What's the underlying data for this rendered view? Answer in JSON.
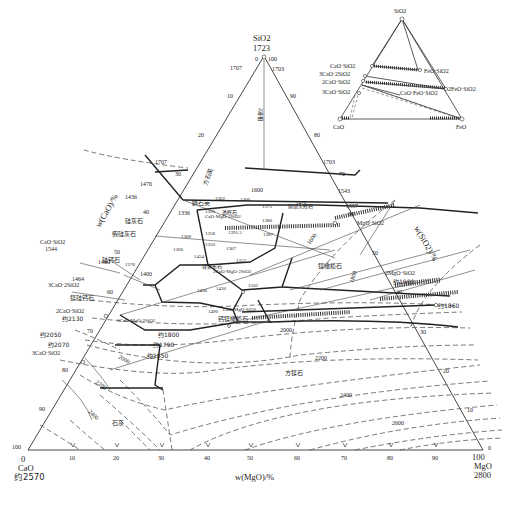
{
  "diagram": {
    "vertices": {
      "top": {
        "label": "SiO2",
        "temp": "1723"
      },
      "left": {
        "label": "CaO",
        "temp": "约2570",
        "tick": "0"
      },
      "right": {
        "label": "MgO",
        "temp": "2800",
        "tick": "100"
      }
    },
    "axes": {
      "bottom": {
        "label": "w(MgO)/%",
        "ticks": [
          "0",
          "10",
          "20",
          "30",
          "40",
          "50",
          "60",
          "70",
          "80",
          "90",
          "100"
        ]
      },
      "left": {
        "label": "w(CaO)/%",
        "ticks": [
          "10",
          "20",
          "30",
          "40",
          "50",
          "60",
          "70",
          "80",
          "90",
          "100"
        ]
      },
      "right": {
        "label": "w(SiO2)/%",
        "ticks": [
          "90",
          "80",
          "70",
          "60",
          "50",
          "40",
          "30",
          "20",
          "10",
          "0"
        ]
      },
      "top_ticks": {
        "left": "0",
        "right": "100"
      }
    },
    "compounds": [
      {
        "label": "CaO·SiO2",
        "temp": "1544"
      },
      {
        "label": "3CaO·2SiO2",
        "temp": "1464"
      },
      {
        "label": "2CaO·SiO2",
        "temp": "约2130"
      },
      {
        "label": "3CaO·SiO2",
        "temp": "约2070"
      },
      {
        "label": "MgO·SiO2",
        "temp": "1557"
      },
      {
        "label": "2MgO·SiO2",
        "temp": "约1900"
      },
      {
        "label": "CaO·MgO·2SiO2",
        "temp": "1390"
      },
      {
        "label": "2CaO·MgO·2SiO2",
        "temp": ""
      },
      {
        "label": "3CaO·MgO·2SiO2",
        "temp": ""
      },
      {
        "label": "CaO·MgO·SiO2",
        "temp": "1490"
      }
    ],
    "phase_regions": [
      "方石英",
      "鳞石英",
      "硅灰石",
      "假硅灰石",
      "硅钙石",
      "镁硅钙石",
      "透辉石",
      "镁黄长石",
      "原顽火辉石",
      "镁橄榄石",
      "钙镁橄榄石",
      "方镁石",
      "石灰",
      "2液相"
    ],
    "temperatures": {
      "left_edge": [
        "1707",
        "1470",
        "1436",
        "1336",
        "1544",
        "1460",
        "1464",
        "约2130",
        "约2050",
        "约2070"
      ],
      "right_edge": [
        "1703",
        "1543",
        "1557",
        "约1900",
        "约1860"
      ],
      "top": [
        "1707",
        "1703"
      ],
      "invariant_points": [
        "1362",
        "1400",
        "1470",
        "1320",
        "1375",
        "1380",
        "1368",
        "1358",
        "1350",
        "1360",
        "1367",
        "1387",
        "1391.5",
        "1454",
        "1357",
        "1400",
        "1436",
        "1430",
        "1502",
        "1490",
        "约1800",
        "约1790",
        "约1850",
        "1376"
      ]
    },
    "isotherms": [
      "1600",
      "1600",
      "1800",
      "2000",
      "2000",
      "2200",
      "2200",
      "2400",
      "2400",
      "2600"
    ]
  },
  "inset": {
    "vertices": {
      "top": "SiO2",
      "left": "CaO",
      "right": "FeO"
    },
    "compounds": [
      "CaO·SiO2",
      "3CaO·2SiO2",
      "2CaO·SiO2",
      "3CaO·SiO2",
      "FeO·SiO2",
      "2FeO·SiO2",
      "CaO·FeO·SiO2"
    ]
  }
}
